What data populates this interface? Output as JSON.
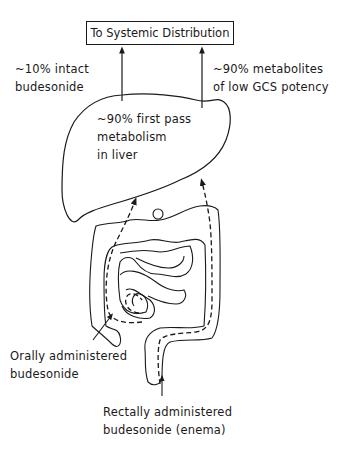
{
  "top_box": {
    "label": "To Systemic Distribution"
  },
  "labels": {
    "left_arrow": {
      "line1": "~10% intact",
      "line2": "budesonide"
    },
    "right_arrow": {
      "line1": "~90% metabolites",
      "line2": "of low GCS potency"
    },
    "liver": {
      "line1": "~90% first pass",
      "line2": "metabolism",
      "line3": "in liver"
    },
    "oral": {
      "line1": "Orally administered",
      "line2": "budesonide"
    },
    "rectal": {
      "line1": "Rectally administered",
      "line2": "budesonide (enema)"
    }
  },
  "organs": [
    "liver",
    "small-intestine",
    "colon"
  ],
  "colors": {
    "line": "#1a1a1a",
    "background": "#ffffff"
  }
}
